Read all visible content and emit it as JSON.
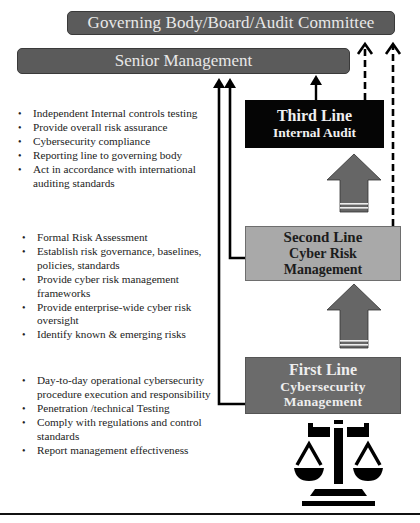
{
  "diagram": {
    "governing_body": {
      "label": "Governing Body/Board/Audit Committee",
      "color": "#5b5b5b"
    },
    "senior_management": {
      "label": "Senior Management",
      "color": "#5b5b5b"
    },
    "lines": [
      {
        "id": "third",
        "title": "Third Line",
        "subtitle": "Internal Audit",
        "color": "#050505",
        "responsibilities": [
          "Independent Internal controls testing",
          "Provide overall risk assurance",
          "Cybersecurity compliance",
          "Reporting line to governing body",
          "Act in accordance with international auditing standards"
        ]
      },
      {
        "id": "second",
        "title": "Second Line",
        "subtitle": "Cyber Risk Management",
        "subtitle_line1": "Cyber Risk",
        "subtitle_line2": "Management",
        "color": "#a9a9a9",
        "responsibilities": [
          "Formal Risk Assessment",
          "Establish risk governance, baselines, policies, standards",
          "Provide cyber risk management frameworks",
          "Provide enterprise-wide cyber risk oversight",
          "Identify known & emerging risks"
        ]
      },
      {
        "id": "first",
        "title": "First Line",
        "subtitle": "Cybersecurity Management",
        "subtitle_line1": "Cybersecurity",
        "subtitle_line2": "Management",
        "color": "#6b6b6b",
        "responsibilities": [
          "Day-to-day operational cybersecurity procedure execution and responsibility",
          "Penetration /technical Testing",
          "Comply with regulations and control standards",
          "Report management effectiveness"
        ]
      }
    ],
    "icons": {
      "bottom": "scales-of-justice-icon",
      "connectors": "up-arrow-icon"
    }
  }
}
